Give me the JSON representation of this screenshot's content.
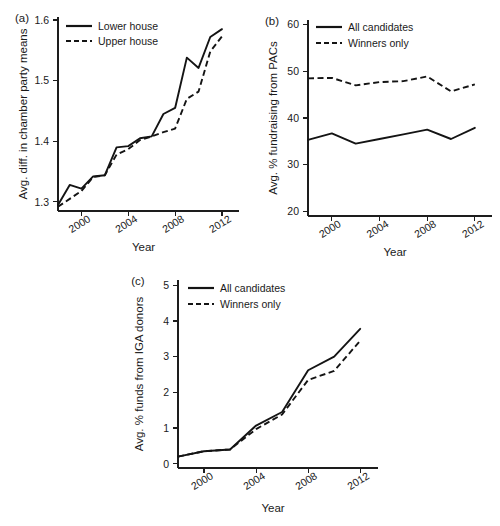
{
  "figure": {
    "background": "#ffffff",
    "line_color": "#141414",
    "panels": [
      "a",
      "b",
      "c"
    ]
  },
  "chart_data": [
    {
      "panel": "a",
      "panel_label": "(a)",
      "type": "line",
      "title": "",
      "xlabel": "Year",
      "ylabel": "Avg. diff. in chamber party means",
      "xlim": [
        1998,
        2012.6
      ],
      "ylim": [
        1.285,
        1.605
      ],
      "xticks": [
        2000,
        2004,
        2008,
        2012
      ],
      "xtick_labels": [
        "2000",
        "2004",
        "2008",
        "2012"
      ],
      "yticks": [
        1.3,
        1.4,
        1.5,
        1.6
      ],
      "ytick_labels": [
        "1.3",
        "1.4",
        "1.5",
        "1.6"
      ],
      "grid": false,
      "legend_position": "top-left",
      "x": [
        1998,
        1999,
        2000,
        2001,
        2002,
        2003,
        2004,
        2005,
        2006,
        2007,
        2008,
        2009,
        2010,
        2011,
        2012
      ],
      "series": [
        {
          "name": "Lower house",
          "style": "solid",
          "values": [
            1.295,
            1.328,
            1.322,
            1.342,
            1.344,
            1.39,
            1.392,
            1.405,
            1.408,
            1.445,
            1.455,
            1.538,
            1.521,
            1.572,
            1.585
          ]
        },
        {
          "name": "Upper house",
          "style": "dashed",
          "values": [
            1.292,
            1.305,
            1.318,
            1.341,
            1.344,
            1.378,
            1.387,
            1.402,
            1.408,
            1.415,
            1.421,
            1.47,
            1.482,
            1.548,
            1.573
          ]
        }
      ]
    },
    {
      "panel": "b",
      "panel_label": "(b)",
      "type": "line",
      "title": "",
      "xlabel": "Year",
      "ylabel": "Avg. % fundraising from PACs",
      "xlim": [
        1998,
        2012.6
      ],
      "ylim": [
        19.0,
        61.0
      ],
      "xticks": [
        2000,
        2004,
        2008,
        2012
      ],
      "xtick_labels": [
        "2000",
        "2004",
        "2008",
        "2012"
      ],
      "yticks": [
        20,
        30,
        40,
        50,
        60
      ],
      "ytick_labels": [
        "20",
        "30",
        "40",
        "50",
        "60"
      ],
      "grid": false,
      "legend_position": "top-left",
      "x": [
        1998,
        2000,
        2002,
        2004,
        2006,
        2008,
        2010,
        2012
      ],
      "series": [
        {
          "name": "All candidates",
          "style": "solid",
          "values": [
            35.3,
            36.7,
            34.5,
            35.5,
            36.5,
            37.5,
            35.5,
            37.9
          ]
        },
        {
          "name": "Winners only",
          "style": "dashed",
          "values": [
            48.5,
            48.6,
            47.0,
            47.7,
            47.9,
            48.9,
            45.7,
            47.2
          ]
        }
      ]
    },
    {
      "panel": "c",
      "panel_label": "(c)",
      "type": "line",
      "title": "",
      "xlabel": "Year",
      "ylabel": "Avg. % funds from IGA donors",
      "xlim": [
        1998,
        2012.6
      ],
      "ylim": [
        -0.12,
        5.15
      ],
      "xticks": [
        2000,
        2004,
        2008,
        2012
      ],
      "xtick_labels": [
        "2000",
        "2004",
        "2008",
        "2012"
      ],
      "yticks": [
        0,
        1,
        2,
        3,
        4,
        5
      ],
      "ytick_labels": [
        "0",
        "1",
        "2",
        "3",
        "4",
        "5"
      ],
      "grid": false,
      "legend_position": "top-left",
      "x": [
        1998,
        2000,
        2002,
        2004,
        2006,
        2008,
        2010,
        2012
      ],
      "series": [
        {
          "name": "All candidates",
          "style": "solid",
          "values": [
            0.2,
            0.35,
            0.4,
            1.07,
            1.45,
            2.62,
            3.0,
            3.78
          ]
        },
        {
          "name": "Winners only",
          "style": "dashed",
          "values": [
            0.2,
            0.35,
            0.4,
            0.97,
            1.38,
            2.35,
            2.6,
            3.45
          ]
        }
      ]
    }
  ]
}
